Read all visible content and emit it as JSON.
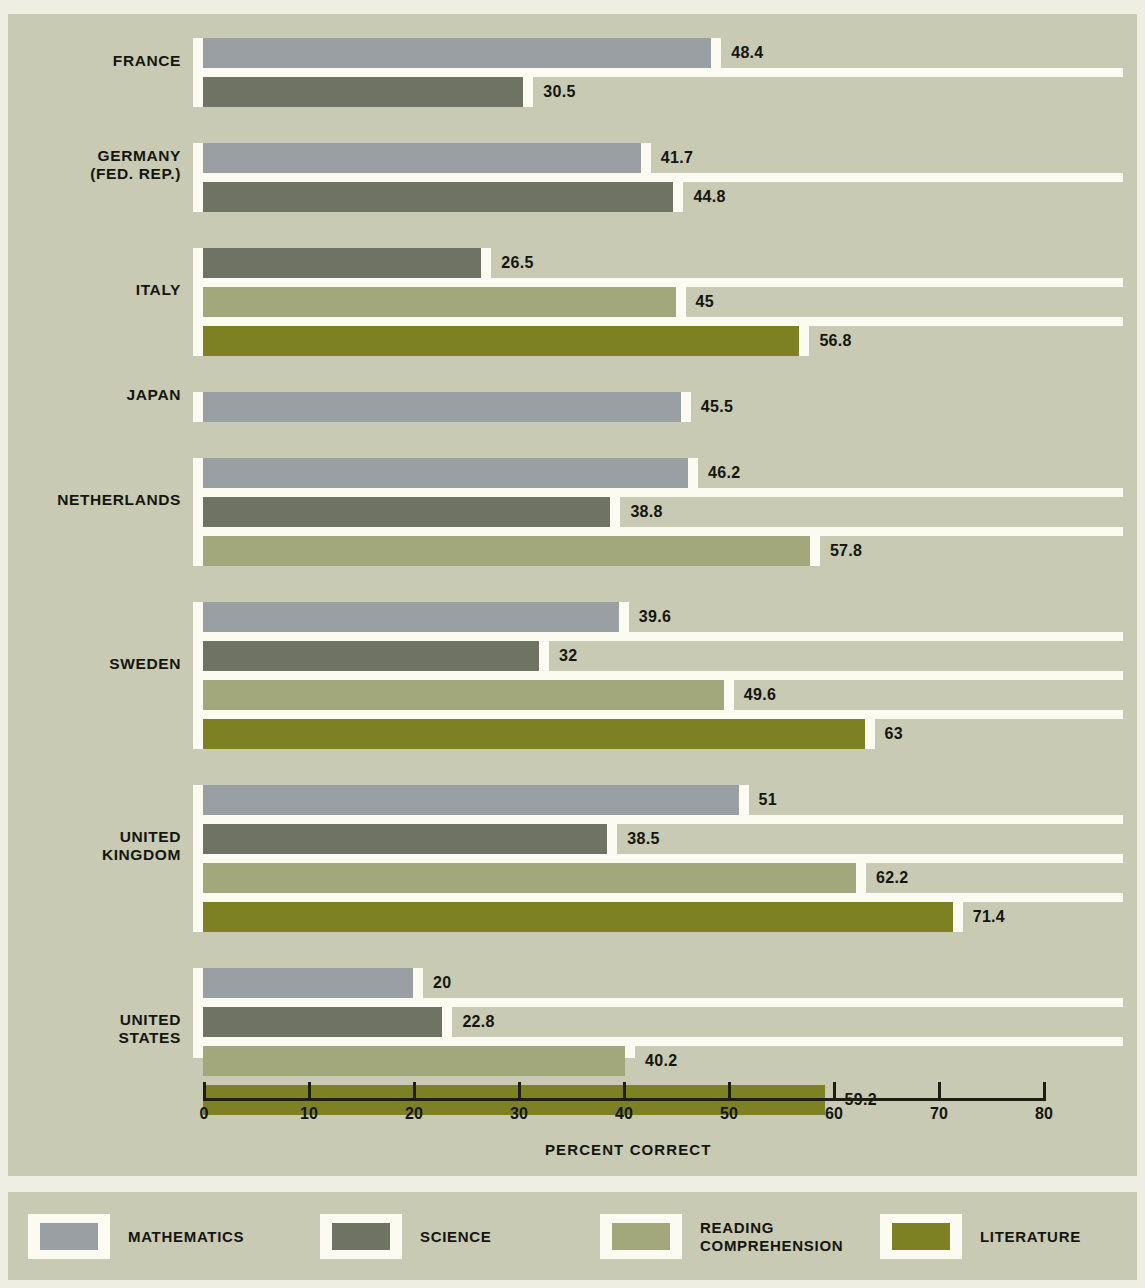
{
  "chart_data": {
    "type": "bar",
    "orientation": "horizontal",
    "title": "",
    "xlabel": "PERCENT CORRECT",
    "ylabel": "",
    "xlim": [
      0,
      80
    ],
    "xticks": [
      "0",
      "10",
      "20",
      "30",
      "40",
      "50",
      "60",
      "70",
      "80"
    ],
    "grid": false,
    "legend_position": "bottom",
    "categories": [
      "FRANCE",
      "GERMANY\n(FED. REP.)",
      "ITALY",
      "JAPAN",
      "NETHERLANDS",
      "SWEDEN",
      "UNITED\nKINGDOM",
      "UNITED\nSTATES"
    ],
    "series": [
      {
        "name": "MATHEMATICS",
        "color": "#9a9fa4",
        "values": [
          48.4,
          41.7,
          null,
          45.5,
          46.2,
          39.6,
          51,
          20
        ]
      },
      {
        "name": "SCIENCE",
        "color": "#6f7363",
        "values": [
          30.5,
          44.8,
          26.5,
          null,
          38.8,
          32,
          38.5,
          22.8
        ]
      },
      {
        "name": "READING\nCOMPREHENSION",
        "color": "#a2a87c",
        "values": [
          null,
          null,
          45,
          null,
          57.8,
          49.6,
          62.2,
          40.2
        ]
      },
      {
        "name": "LITERATURE",
        "color": "#7e8024",
        "values": [
          null,
          null,
          56.8,
          null,
          null,
          63,
          71.4,
          59.2
        ]
      }
    ],
    "value_labels": {
      "FRANCE": [
        "48.4",
        "30.5"
      ],
      "GERMANY": [
        "41.7",
        "44.8"
      ],
      "ITALY": [
        "26.5",
        "45",
        "56.8"
      ],
      "JAPAN": [
        "45.5"
      ],
      "NETHERLANDS": [
        "46.2",
        "38.8",
        "57.8"
      ],
      "SWEDEN": [
        "39.6",
        "32",
        "49.6",
        "63"
      ],
      "UNITED KINGDOM": [
        "51",
        "38.5",
        "62.2",
        "71.4"
      ],
      "UNITED STATES": [
        "20",
        "22.8",
        "40.2",
        "59.2"
      ]
    }
  },
  "legend": [
    {
      "label": "MATHEMATICS",
      "color": "#9a9fa4"
    },
    {
      "label": "SCIENCE",
      "color": "#6f7363"
    },
    {
      "label": "READING\nCOMPREHENSION",
      "color": "#a2a87c"
    },
    {
      "label": "LITERATURE",
      "color": "#7e8024"
    }
  ],
  "colors": {
    "background": "#c8cab3",
    "page": "#efeee2",
    "panel_white": "#fbfbf2",
    "text": "#15150f",
    "axis": "#1d1d14"
  }
}
